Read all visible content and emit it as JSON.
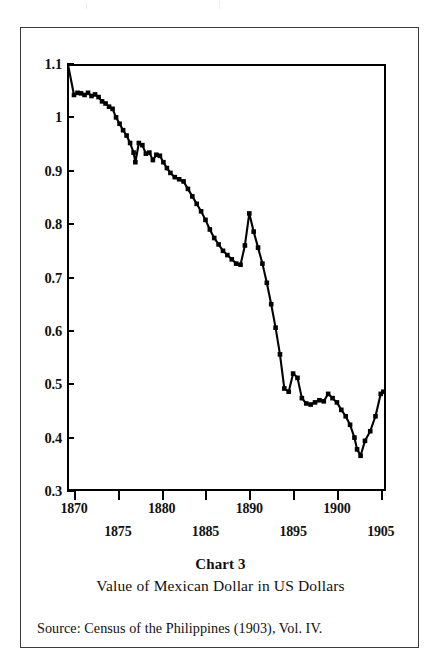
{
  "figure": {
    "chart_number_label": "Chart 3",
    "subtitle": "Value of Mexican Dollar in US Dollars",
    "source_note": "Source:  Census of the Philippines (1903), Vol. IV.",
    "line_color": "#000000",
    "frame_color": "#000000",
    "border_color": "#3a3a3a",
    "background_color": "#ffffff"
  },
  "chart_data": {
    "type": "line",
    "title": "Chart 3",
    "subtitle": "Value of Mexican Dollar in US Dollars",
    "xlabel": "",
    "ylabel": "",
    "xlim": [
      1869.2,
      1905.6
    ],
    "ylim": [
      0.3,
      1.1
    ],
    "grid": false,
    "legend": "none",
    "marker": "small-square",
    "ytick_labels": [
      "1.1",
      "1",
      "0.9",
      "0.8",
      "0.7",
      "0.6",
      "0.5",
      "0.4",
      "0.3"
    ],
    "ytick_values": [
      1.1,
      1.0,
      0.9,
      0.8,
      0.7,
      0.6,
      0.5,
      0.4,
      0.3
    ],
    "xtick_labels": [
      "1870",
      "1875",
      "1880",
      "1885",
      "1890",
      "1895",
      "1900",
      "1905"
    ],
    "xtick_values": [
      1870,
      1875,
      1880,
      1885,
      1890,
      1895,
      1900,
      1905
    ],
    "xtick_label_rows": [
      "top",
      "bottom",
      "top",
      "bottom",
      "top",
      "bottom",
      "top",
      "bottom"
    ],
    "series": [
      {
        "name": "Value of Mexican Dollar in US Dollars",
        "x": [
          1869.3,
          1870.0,
          1870.4,
          1870.8,
          1871.2,
          1871.6,
          1872.0,
          1872.4,
          1872.8,
          1873.2,
          1873.6,
          1874.0,
          1874.4,
          1874.8,
          1875.2,
          1875.6,
          1876.0,
          1876.4,
          1876.8,
          1877.0,
          1877.4,
          1877.8,
          1878.2,
          1878.6,
          1879.0,
          1879.4,
          1879.8,
          1880.2,
          1880.6,
          1881.0,
          1881.5,
          1882.0,
          1882.5,
          1883.0,
          1883.5,
          1884.0,
          1884.5,
          1885.0,
          1885.5,
          1886.0,
          1886.5,
          1887.0,
          1887.5,
          1888.0,
          1888.5,
          1889.0,
          1889.5,
          1890.0,
          1890.5,
          1891.0,
          1891.5,
          1892.0,
          1892.5,
          1893.0,
          1893.5,
          1894.0,
          1894.5,
          1895.0,
          1895.5,
          1896.0,
          1896.5,
          1897.0,
          1897.5,
          1898.0,
          1898.5,
          1899.0,
          1899.5,
          1900.0,
          1900.5,
          1901.0,
          1901.5,
          1902.0,
          1902.3,
          1902.7,
          1903.2,
          1903.8,
          1904.4,
          1905.0,
          1905.3
        ],
        "y": [
          1.1,
          1.042,
          1.046,
          1.045,
          1.042,
          1.046,
          1.04,
          1.043,
          1.038,
          1.03,
          1.026,
          1.02,
          1.016,
          1.0,
          0.988,
          0.976,
          0.966,
          0.952,
          0.934,
          0.916,
          0.952,
          0.948,
          0.932,
          0.934,
          0.92,
          0.93,
          0.928,
          0.916,
          0.905,
          0.896,
          0.888,
          0.884,
          0.88,
          0.866,
          0.852,
          0.838,
          0.824,
          0.808,
          0.79,
          0.774,
          0.762,
          0.75,
          0.742,
          0.734,
          0.726,
          0.724,
          0.76,
          0.82,
          0.786,
          0.756,
          0.726,
          0.69,
          0.65,
          0.606,
          0.556,
          0.492,
          0.486,
          0.52,
          0.512,
          0.474,
          0.464,
          0.462,
          0.466,
          0.47,
          0.468,
          0.482,
          0.474,
          0.466,
          0.452,
          0.44,
          0.424,
          0.4,
          0.378,
          0.366,
          0.394,
          0.412,
          0.44,
          0.482,
          0.486
        ]
      }
    ],
    "annotations": [],
    "notes": {
      "start_value": 1.1,
      "early_plateau": "approximately 1.04 in 1870-1873",
      "local_dip_1877": 0.916,
      "local_low_1889": 0.724,
      "spike_1890": 0.82,
      "steep_decline": "1891 to 1894 falling from 0.756 to 0.486",
      "plateau_1895_1899": "approximately 0.46 to 0.52",
      "minimum": 0.366,
      "minimum_year": 1902.7,
      "end_value": 0.486
    }
  }
}
